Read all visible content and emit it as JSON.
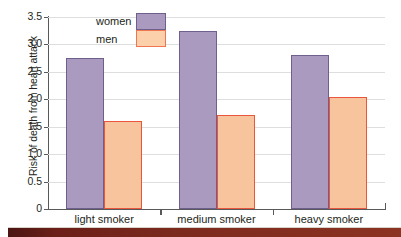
{
  "chart_data": {
    "type": "bar",
    "title": "",
    "xlabel": "",
    "ylabel": "Risk of death from heart attack",
    "categories": [
      "light smoker",
      "medium smoker",
      "heavy smoker"
    ],
    "series": [
      {
        "name": "women",
        "values": [
          2.75,
          3.25,
          2.8
        ],
        "color": "#ab9ac0",
        "border_color": "#6e5f8c"
      },
      {
        "name": "men",
        "values": [
          1.6,
          1.72,
          2.05
        ],
        "color": "#f8c49e",
        "border_color": "#e9563b"
      }
    ],
    "ylim": [
      0,
      3.5
    ],
    "yticks": [
      "0",
      "0.5",
      "1.0",
      "1.5",
      "2.0",
      "2.5",
      "3.0",
      "3.5"
    ],
    "ytick_values": [
      0,
      0.5,
      1.0,
      1.5,
      2.0,
      2.5,
      3.0,
      3.5
    ],
    "grid": true,
    "grid_color": "#dedede",
    "legend": {
      "position": "top-left-inside",
      "entries": [
        "women",
        "men"
      ]
    },
    "axis_color": "#58595b",
    "background": "#ffffff"
  },
  "legend": {
    "women_label": "women",
    "men_label": "men"
  },
  "axis": {
    "ylabel": "Risk of death from heart attack"
  }
}
